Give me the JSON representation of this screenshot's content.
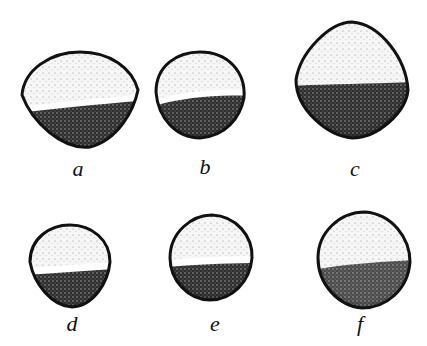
{
  "figure": {
    "colors": {
      "outline": "#111111",
      "light_fill": "#f4f4f4",
      "dark_fill": "#3a3a3a",
      "band": "#ffffff",
      "background": "#ffffff"
    },
    "panels": [
      {
        "id": "a",
        "label": "a",
        "label_x": 78,
        "label_y": 158
      },
      {
        "id": "b",
        "label": "b",
        "label_x": 205,
        "label_y": 156
      },
      {
        "id": "c",
        "label": "c",
        "label_x": 355,
        "label_y": 158
      },
      {
        "id": "d",
        "label": "d",
        "label_x": 72,
        "label_y": 313
      },
      {
        "id": "e",
        "label": "e",
        "label_x": 215,
        "label_y": 313
      },
      {
        "id": "f",
        "label": "f",
        "label_x": 360,
        "label_y": 313
      }
    ]
  }
}
